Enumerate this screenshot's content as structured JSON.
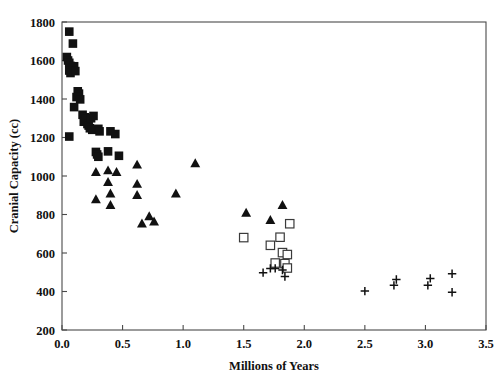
{
  "chart_data": {
    "type": "scatter",
    "title": "",
    "xlabel": "Millions of Years",
    "ylabel": "Cranial Capacity (cc)",
    "xlim": [
      0.0,
      3.5
    ],
    "ylim": [
      200,
      1800
    ],
    "xticks": [
      "0.0",
      "0.5",
      "1.0",
      "1.5",
      "2.0",
      "2.5",
      "3.0",
      "3.5"
    ],
    "xtick_values": [
      0.0,
      0.5,
      1.0,
      1.5,
      2.0,
      2.5,
      3.0,
      3.5
    ],
    "yticks": [
      "200",
      "400",
      "600",
      "800",
      "1000",
      "1200",
      "1400",
      "1600",
      "1800"
    ],
    "ytick_values": [
      200,
      400,
      600,
      800,
      1000,
      1200,
      1400,
      1600,
      1800
    ],
    "grid": false,
    "legend": "none",
    "series": [
      {
        "name": "filled-square",
        "marker": "filled-square",
        "color": "#111111",
        "points": [
          [
            0.06,
            1750
          ],
          [
            0.09,
            1688
          ],
          [
            0.04,
            1618
          ],
          [
            0.05,
            1600
          ],
          [
            0.06,
            1588
          ],
          [
            0.07,
            1572
          ],
          [
            0.08,
            1560
          ],
          [
            0.06,
            1548
          ],
          [
            0.09,
            1556
          ],
          [
            0.07,
            1535
          ],
          [
            0.1,
            1570
          ],
          [
            0.11,
            1545
          ],
          [
            0.13,
            1440
          ],
          [
            0.14,
            1428
          ],
          [
            0.12,
            1410
          ],
          [
            0.15,
            1398
          ],
          [
            0.1,
            1358
          ],
          [
            0.17,
            1318
          ],
          [
            0.19,
            1305
          ],
          [
            0.2,
            1295
          ],
          [
            0.18,
            1282
          ],
          [
            0.21,
            1270
          ],
          [
            0.22,
            1262
          ],
          [
            0.24,
            1300
          ],
          [
            0.26,
            1312
          ],
          [
            0.23,
            1248
          ],
          [
            0.25,
            1240
          ],
          [
            0.06,
            1205
          ],
          [
            0.3,
            1245
          ],
          [
            0.31,
            1232
          ],
          [
            0.4,
            1232
          ],
          [
            0.44,
            1218
          ],
          [
            0.28,
            1125
          ],
          [
            0.29,
            1112
          ],
          [
            0.3,
            1100
          ],
          [
            0.38,
            1128
          ],
          [
            0.47,
            1105
          ]
        ]
      },
      {
        "name": "filled-triangle",
        "marker": "filled-triangle",
        "color": "#111111",
        "points": [
          [
            0.28,
            1020
          ],
          [
            0.38,
            1028
          ],
          [
            0.45,
            1020
          ],
          [
            0.62,
            1058
          ],
          [
            1.1,
            1065
          ],
          [
            0.38,
            968
          ],
          [
            0.62,
            958
          ],
          [
            0.28,
            878
          ],
          [
            0.4,
            908
          ],
          [
            0.62,
            900
          ],
          [
            0.94,
            908
          ],
          [
            0.4,
            848
          ],
          [
            0.66,
            752
          ],
          [
            0.72,
            790
          ],
          [
            0.76,
            762
          ],
          [
            1.52,
            808
          ],
          [
            1.72,
            770
          ],
          [
            1.82,
            848
          ]
        ]
      },
      {
        "name": "open-square",
        "marker": "open-square",
        "color": "#3a3a3a",
        "points": [
          [
            1.5,
            680
          ],
          [
            1.72,
            640
          ],
          [
            1.8,
            682
          ],
          [
            1.88,
            752
          ],
          [
            1.82,
            602
          ],
          [
            1.86,
            592
          ],
          [
            1.76,
            548
          ],
          [
            1.84,
            545
          ],
          [
            1.86,
            522
          ]
        ]
      },
      {
        "name": "plus",
        "marker": "plus",
        "color": "#111111",
        "points": [
          [
            1.66,
            498
          ],
          [
            1.72,
            520
          ],
          [
            1.76,
            520
          ],
          [
            1.82,
            512
          ],
          [
            1.84,
            478
          ],
          [
            2.5,
            402
          ],
          [
            2.74,
            432
          ],
          [
            2.76,
            462
          ],
          [
            3.02,
            432
          ],
          [
            3.04,
            468
          ],
          [
            3.22,
            492
          ],
          [
            3.22,
            396
          ]
        ]
      }
    ]
  },
  "axes": {
    "x_title": "Millions of Years",
    "y_title": "Cranial Capacity (cc)"
  }
}
